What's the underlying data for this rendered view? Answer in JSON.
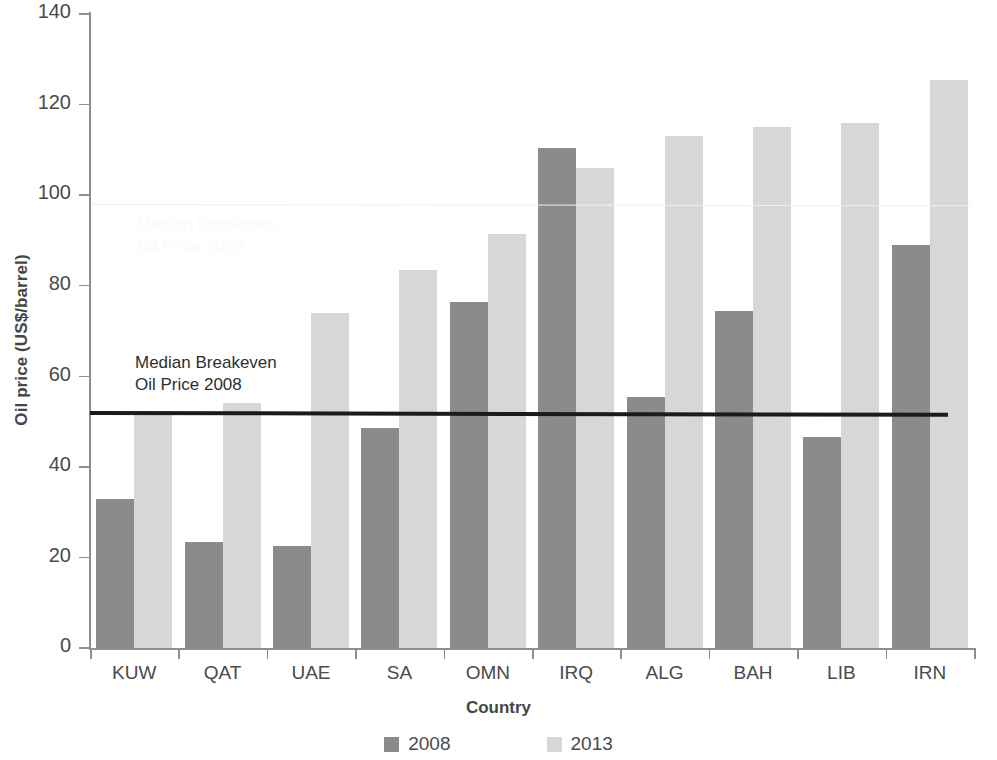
{
  "chart_data": {
    "type": "bar",
    "title": "",
    "xlabel": "Country",
    "ylabel": "Oil price (US$/barrel)",
    "ylim": [
      0,
      140
    ],
    "yticks": [
      0,
      20,
      40,
      60,
      80,
      100,
      120,
      140
    ],
    "grid": false,
    "legend_position": "bottom",
    "categories": [
      "KUW",
      "QAT",
      "UAE",
      "SA",
      "OMN",
      "IRQ",
      "ALG",
      "BAH",
      "LIB",
      "IRN"
    ],
    "series": [
      {
        "name": "2008",
        "color": "#8b8b8b",
        "values": [
          33,
          23.5,
          22.5,
          48.5,
          76.5,
          110.5,
          55.5,
          74.5,
          46.5,
          89
        ]
      },
      {
        "name": "2013",
        "color": "#d7d7d7",
        "values": [
          52,
          54,
          74,
          83.5,
          91.5,
          106,
          113,
          115,
          116,
          125.5
        ]
      }
    ],
    "annotations": [
      {
        "name": "median-breakeven-2008",
        "text": "Median Breakeven\nOil Price 2008",
        "value": 52,
        "line_color": "#1b1b1b"
      },
      {
        "name": "median-breakeven-2013",
        "text": "Median Breakeven\nOil Price 2013",
        "value": 98,
        "line_color": "#f2eef0"
      }
    ]
  },
  "axis": {
    "y_title": "Oil price (US$/barrel)",
    "x_title": "Country",
    "y_labels": [
      "140",
      "120",
      "100",
      "80",
      "60",
      "40",
      "20",
      "0"
    ],
    "x_labels": [
      "KUW",
      "QAT",
      "UAE",
      "SA",
      "OMN",
      "IRQ",
      "ALG",
      "BAH",
      "LIB",
      "IRN"
    ]
  },
  "legend": {
    "items": [
      {
        "label": "2008",
        "color": "#8b8b8b"
      },
      {
        "label": "2013",
        "color": "#d7d7d7"
      }
    ]
  },
  "annotation_2008_text": "Median Breakeven\nOil Price 2008",
  "annotation_2013_text": "Median Breakeven\nOil Price 2013"
}
